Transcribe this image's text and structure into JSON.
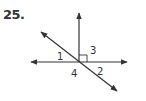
{
  "problem": {
    "number": "25."
  },
  "figure": {
    "angle_labels": {
      "a1": "1",
      "a2": "2",
      "a3": "3",
      "a4": "4"
    },
    "line_color": "#333333",
    "right_angle_marker": true
  }
}
